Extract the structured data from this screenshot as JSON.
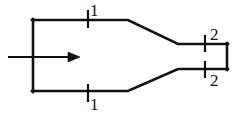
{
  "figure": {
    "kind": "engineering-diagram",
    "background_color": "#ffffff",
    "line_color": "#111111",
    "canvas": {
      "width": 243,
      "height": 122
    }
  },
  "stations": {
    "inlet": {
      "label": "1",
      "top_tick_label": "1",
      "bottom_tick_label": "1"
    },
    "exit": {
      "label": "2",
      "top_tick_label": "2",
      "bottom_tick_label": "2"
    }
  },
  "flow": {
    "arrow_label": "",
    "direction": "left-to-right"
  },
  "geometry": {
    "inlet_top_y": 20,
    "inlet_bottom_y": 91,
    "inlet_left_x": 32,
    "taper_start_x": 128,
    "throat_start_x": 178,
    "throat_end_x": 228,
    "throat_top_y": 44,
    "throat_bottom_y": 69,
    "arrow_y": 57,
    "arrow_start_x": 8,
    "arrow_tip_x": 80,
    "tick_inlet_x": 88,
    "tick_exit_x": 205,
    "stroke_width": 2.6
  }
}
